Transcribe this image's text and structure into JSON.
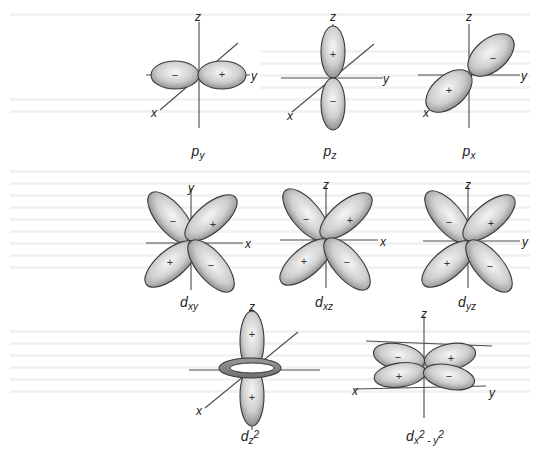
{
  "figure": {
    "colors": {
      "lobe_fill_light": "#f4f4f4",
      "lobe_fill_dark": "#9a9a9a",
      "outline": "#3a3a3a",
      "axis": "#4a4a4a",
      "background": "#ffffff"
    },
    "orbitals": [
      {
        "id": "py",
        "label_main": "p",
        "label_sub": "y",
        "axes": [
          "z",
          "y",
          "x"
        ],
        "lobes": [
          {
            "sign": "−"
          },
          {
            "sign": "+"
          }
        ]
      },
      {
        "id": "pz",
        "label_main": "p",
        "label_sub": "z",
        "axes": [
          "z",
          "y",
          "x"
        ],
        "lobes": [
          {
            "sign": "+"
          },
          {
            "sign": "−"
          }
        ]
      },
      {
        "id": "px",
        "label_main": "p",
        "label_sub": "x",
        "axes": [
          "z",
          "y",
          "x"
        ],
        "lobes": [
          {
            "sign": "−"
          },
          {
            "sign": "+"
          }
        ]
      },
      {
        "id": "dxy",
        "label_main": "d",
        "label_sub": "xy",
        "axes": [
          "y",
          "x"
        ],
        "lobes": [
          {
            "sign": "−"
          },
          {
            "sign": "+"
          },
          {
            "sign": "+"
          },
          {
            "sign": "−"
          }
        ]
      },
      {
        "id": "dxz",
        "label_main": "d",
        "label_sub": "xz",
        "axes": [
          "z",
          "x"
        ],
        "lobes": [
          {
            "sign": "−"
          },
          {
            "sign": "+"
          },
          {
            "sign": "+"
          },
          {
            "sign": "−"
          }
        ]
      },
      {
        "id": "dyz",
        "label_main": "d",
        "label_sub": "yz",
        "axes": [
          "z",
          "y"
        ],
        "lobes": [
          {
            "sign": "−"
          },
          {
            "sign": "+"
          },
          {
            "sign": "+"
          },
          {
            "sign": "−"
          }
        ]
      },
      {
        "id": "dz2",
        "label_main": "d",
        "label_sub": "z",
        "label_sup": "2",
        "axes": [
          "z",
          "x"
        ],
        "lobes": [
          {
            "sign": "+"
          },
          {
            "sign": "+"
          }
        ]
      },
      {
        "id": "dx2y2",
        "label_main": "d",
        "label_sub": "x",
        "label_sup": "2",
        "label_tail": " - y",
        "label_tail_sup": "2",
        "axes": [
          "z",
          "x",
          "y"
        ],
        "lobes": [
          {
            "sign": "−"
          },
          {
            "sign": "+"
          },
          {
            "sign": "+"
          },
          {
            "sign": "−"
          }
        ]
      }
    ]
  }
}
